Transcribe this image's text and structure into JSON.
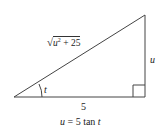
{
  "diagram": {
    "type": "right-triangle",
    "hypotenuse_label": {
      "radical": "√",
      "radicand_var": "u",
      "radicand_exp": "2",
      "radicand_rest": " + 25"
    },
    "opposite_label": "u",
    "adjacent_label": "5",
    "angle_label": "t",
    "equation": {
      "lhs": "u",
      "rest": " = 5 tan ",
      "var": "t"
    },
    "vertices": {
      "left": [
        14,
        97
      ],
      "right_angle": [
        145,
        97
      ],
      "top": [
        145,
        15
      ]
    },
    "line_color": "#444444"
  }
}
